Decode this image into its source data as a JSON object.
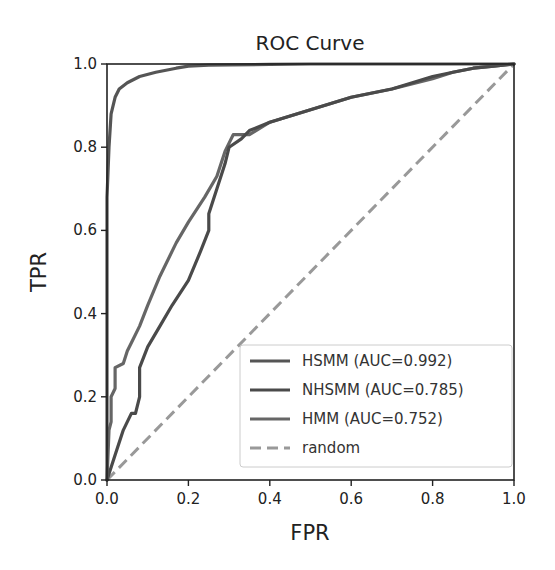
{
  "chart_data": {
    "type": "line",
    "title": "ROC Curve",
    "xlabel": "FPR",
    "ylabel": "TPR",
    "xlim": [
      0.0,
      1.0
    ],
    "ylim": [
      0.0,
      1.0
    ],
    "grid": false,
    "legend_position": "lower right",
    "x_ticks": [
      "0.0",
      "0.2",
      "0.4",
      "0.6",
      "0.8",
      "1.0"
    ],
    "y_ticks": [
      "0.0",
      "0.2",
      "0.4",
      "0.6",
      "0.8",
      "1.0"
    ],
    "series": [
      {
        "name": "HSMM (AUC=0.992)",
        "label": "HSMM (AUC=0.992)",
        "auc": 0.992,
        "color": "#555555",
        "style": "solid",
        "x": [
          0.0,
          0.0,
          0.005,
          0.01,
          0.015,
          0.02,
          0.03,
          0.05,
          0.08,
          0.12,
          0.17,
          0.2,
          0.25,
          0.3,
          0.4,
          0.5,
          0.6,
          0.7,
          0.8,
          0.9,
          1.0
        ],
        "y": [
          0.0,
          0.68,
          0.8,
          0.88,
          0.9,
          0.92,
          0.94,
          0.955,
          0.97,
          0.98,
          0.99,
          0.995,
          0.997,
          0.998,
          0.999,
          1.0,
          1.0,
          1.0,
          1.0,
          1.0,
          1.0
        ]
      },
      {
        "name": "NHSMM (AUC=0.785)",
        "label": "NHSMM (AUC=0.785)",
        "auc": 0.785,
        "color": "#4a4a4a",
        "style": "solid",
        "x": [
          0.0,
          0.02,
          0.04,
          0.06,
          0.07,
          0.08,
          0.08,
          0.1,
          0.13,
          0.16,
          0.2,
          0.23,
          0.25,
          0.25,
          0.27,
          0.29,
          0.3,
          0.33,
          0.35,
          0.4,
          0.5,
          0.6,
          0.7,
          0.8,
          0.85,
          0.9,
          0.95,
          1.0
        ],
        "y": [
          0.0,
          0.06,
          0.12,
          0.16,
          0.16,
          0.2,
          0.27,
          0.32,
          0.37,
          0.42,
          0.48,
          0.55,
          0.6,
          0.64,
          0.7,
          0.76,
          0.8,
          0.82,
          0.84,
          0.86,
          0.89,
          0.92,
          0.94,
          0.97,
          0.98,
          0.99,
          0.995,
          1.0
        ]
      },
      {
        "name": "HMM (AUC=0.752)",
        "label": "HMM (AUC=0.752)",
        "auc": 0.752,
        "color": "#666666",
        "style": "solid",
        "x": [
          0.0,
          0.005,
          0.01,
          0.01,
          0.02,
          0.02,
          0.04,
          0.05,
          0.06,
          0.08,
          0.1,
          0.13,
          0.17,
          0.2,
          0.24,
          0.27,
          0.29,
          0.31,
          0.35,
          0.4,
          0.5,
          0.6,
          0.7,
          0.8,
          0.85,
          0.9,
          0.95,
          1.0
        ],
        "y": [
          0.0,
          0.12,
          0.14,
          0.2,
          0.22,
          0.27,
          0.28,
          0.31,
          0.33,
          0.37,
          0.42,
          0.49,
          0.57,
          0.62,
          0.68,
          0.73,
          0.79,
          0.83,
          0.83,
          0.86,
          0.89,
          0.92,
          0.94,
          0.965,
          0.98,
          0.99,
          0.995,
          1.0
        ]
      },
      {
        "name": "random",
        "label": "random",
        "color": "#999999",
        "style": "dashed",
        "x": [
          0.0,
          1.0
        ],
        "y": [
          0.0,
          1.0
        ]
      }
    ]
  }
}
